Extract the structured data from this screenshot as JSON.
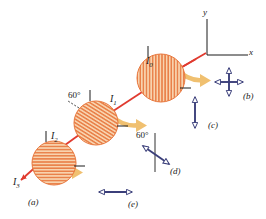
{
  "figure": {
    "type": "physics-optics-diagram",
    "axes": {
      "x_label": "x",
      "y_label": "y"
    },
    "beam": {
      "color": "#e03a2f",
      "direction": "from upper-right to lower-left"
    },
    "intensity_labels": [
      {
        "id": "I0",
        "text": "I",
        "sub": "0"
      },
      {
        "id": "I1",
        "text": "I",
        "sub": "1"
      },
      {
        "id": "I2",
        "text": "I",
        "sub": "2"
      },
      {
        "id": "I3",
        "text": "I",
        "sub": "3"
      }
    ],
    "polarizers": [
      {
        "id": "sheet-1",
        "intensity_in": "I0",
        "hatch": "vertical",
        "angle_deg": 0,
        "fill": "#f6c9a0",
        "stripe": "#e8763c"
      },
      {
        "id": "sheet-2",
        "intensity_in": "I1",
        "hatch": "diagonal",
        "angle_deg": 60,
        "angle_label": "60°",
        "fill": "#f6c9a0",
        "stripe": "#e8763c"
      },
      {
        "id": "sheet-3",
        "intensity_in": "I2",
        "hatch": "horizontal",
        "angle_deg": 90,
        "fill": "#f6c9a0",
        "stripe": "#e8763c"
      }
    ],
    "curved_arrows": {
      "count": 3,
      "color": "#f0c070",
      "direction": "right"
    },
    "legend": [
      {
        "key": "a",
        "label": "(a)",
        "kind": "beam-arrow",
        "description": "incident red beam arrow"
      },
      {
        "key": "b",
        "label": "(b)",
        "kind": "cross-double-arrow",
        "description": "unpolarized: vertical and horizontal double arrows"
      },
      {
        "key": "c",
        "label": "(c)",
        "kind": "vertical-double-arrow",
        "description": "vertical polarization"
      },
      {
        "key": "d",
        "label": "(d)",
        "kind": "diagonal-double-arrow",
        "angle_label": "60°",
        "description": "polarization at 60 degrees from vertical"
      },
      {
        "key": "e",
        "label": "(e)",
        "kind": "horizontal-double-arrow",
        "description": "horizontal polarization"
      }
    ],
    "colors": {
      "beam_red": "#e03a2f",
      "arrow_navy": "#3b3f7a",
      "curved_yellow": "#f0c070",
      "sheet_fill": "#f6c9a0",
      "sheet_stripe": "#e8763c",
      "axis_black": "#1a1a1a"
    }
  }
}
